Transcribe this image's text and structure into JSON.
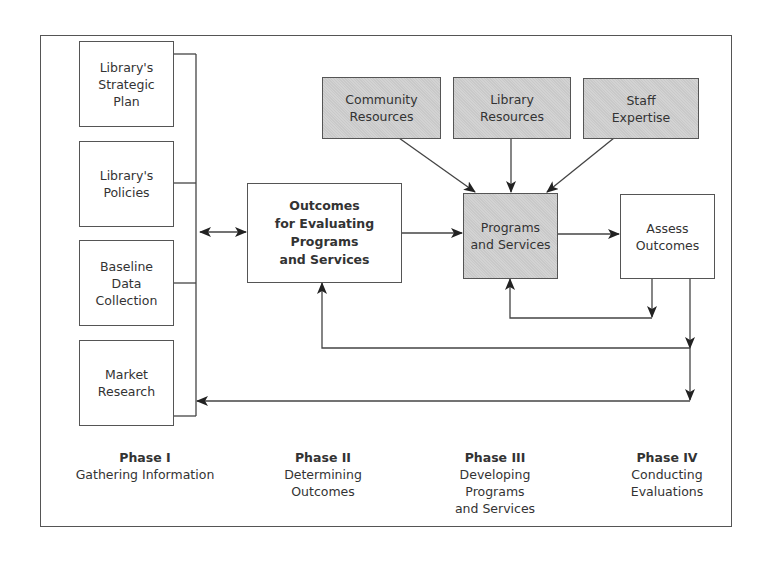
{
  "diagram": {
    "nodes": {
      "strategic_plan": "Library's\nStrategic\nPlan",
      "policies": "Library's\nPolicies",
      "baseline": "Baseline\nData\nCollection",
      "market_research": "Market\nResearch",
      "outcomes": "Outcomes\nfor Evaluating\nPrograms\nand Services",
      "community_resources": "Community\nResources",
      "library_resources": "Library\nResources",
      "staff_expertise": "Staff\nExpertise",
      "programs_services": "Programs\nand Services",
      "assess_outcomes": "Assess\nOutcomes"
    },
    "edges": [
      {
        "from": "phase1-inputs",
        "to": "outcomes",
        "type": "bidirectional"
      },
      {
        "from": "outcomes",
        "to": "programs_services"
      },
      {
        "from": "community_resources",
        "to": "programs_services"
      },
      {
        "from": "library_resources",
        "to": "programs_services"
      },
      {
        "from": "staff_expertise",
        "to": "programs_services"
      },
      {
        "from": "programs_services",
        "to": "assess_outcomes"
      },
      {
        "from": "assess_outcomes",
        "to": "programs_services",
        "type": "feedback"
      },
      {
        "from": "assess_outcomes",
        "to": "outcomes",
        "type": "feedback"
      },
      {
        "from": "assess_outcomes",
        "to": "phase1-inputs",
        "type": "feedback"
      }
    ],
    "colors": {
      "line": "#333333",
      "shaded_fill": "#c9c9c9",
      "border": "#555555"
    },
    "phases": [
      {
        "title": "Phase I",
        "desc": "Gathering Information"
      },
      {
        "title": "Phase II",
        "desc": "Determining\nOutcomes"
      },
      {
        "title": "Phase III",
        "desc": "Developing\nPrograms\nand Services"
      },
      {
        "title": "Phase IV",
        "desc": "Conducting\nEvaluations"
      }
    ]
  }
}
